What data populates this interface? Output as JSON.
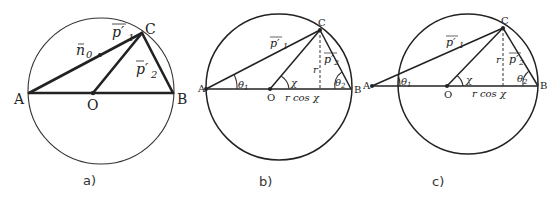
{
  "figures": [
    {
      "caption": "a)",
      "points": {
        "A": "A",
        "O": "O",
        "B": "B",
        "C": "C"
      },
      "vectors": {
        "n0": "n",
        "n0_sub": "0",
        "p1": "p′",
        "p1_sub": "1",
        "p2": "p′",
        "p2_sub": "2"
      }
    },
    {
      "caption": "b)",
      "points": {
        "A": "A",
        "O": "O",
        "B": "B",
        "C": "C"
      },
      "vectors": {
        "p1": "p′",
        "p1_sub": "1",
        "p2": "p′",
        "p2_sub": "2"
      },
      "angles": {
        "theta1": "θ",
        "theta1_sub": "1",
        "chi": "χ",
        "theta2": "θ",
        "theta2_sub": "2"
      },
      "lengths": {
        "r": "r",
        "rcos": "r cos χ"
      }
    },
    {
      "caption": "c)",
      "points": {
        "A": "A",
        "O": "O",
        "B": "B",
        "C": "C"
      },
      "vectors": {
        "p1": "p′",
        "p1_sub": "1",
        "p2": "p′",
        "p2_sub": "2"
      },
      "angles": {
        "theta1": "θ",
        "theta1_sub": "1",
        "chi": "χ",
        "theta2": "θ",
        "theta2_sub": "2"
      },
      "lengths": {
        "r": "r",
        "rcos": "r cos χ"
      }
    }
  ]
}
